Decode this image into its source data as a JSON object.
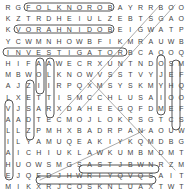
{
  "puzzle": {
    "rows": [
      "RGFOLKNOROBAYRRBOO",
      "KZTRDHEIULZEBTSGAO",
      "KVORAHNIDOBEIGWATP",
      "YCWMNHOWBFIKMRAUWB",
      "INVESTIGATORBCAOOQ",
      "HIFAAWECRXUNTNDOSM",
      "MBWOLKNOWVSSTVYJEF",
      "AJZIIRPQXMSYSKMYHQ",
      "LXETTISMCCHLUSAIOO",
      "VJSARXDAHEEGQFDMEF",
      "AADTECMOJLOKPSGTCS",
      "LLZPMHXBADRPANAOUW",
      "ILYAMUQEAKIYKQMDBG",
      "AICHIUKLAWKUMBMDMT",
      "HUOWSMGSASTJBWNRZM",
      "EJQEDJHWRIYQVQSAIT",
      "MIKXRJCOSKNLUAXTWT",
      "MAPBQKJTTBPZVUXTTO",
      "UYEBUFXOSCOTLANDYZ",
      "GGOCELTICPAGANISMRV"
    ]
  },
  "found_words": [
    {
      "word": "FOLKNORO",
      "row": 0,
      "col_start": 2,
      "col_end": 10,
      "dir": "horizontal"
    },
    {
      "word": "VORAHNIDO",
      "row": 2,
      "col_start": 1,
      "col_end": 10,
      "dir": "horizontal"
    },
    {
      "word": "INVESTIGATOR",
      "row": 4,
      "col_start": 0,
      "col_end": 11,
      "dir": "horizontal"
    },
    {
      "word": "SCOTLAND",
      "row": 18,
      "col_start": 8,
      "col_end": 15,
      "dir": "horizontal"
    },
    {
      "word": "CELTICPAGANISM",
      "row": 19,
      "col_start": 3,
      "col_end": 16,
      "dir": "horizontal"
    }
  ]
}
